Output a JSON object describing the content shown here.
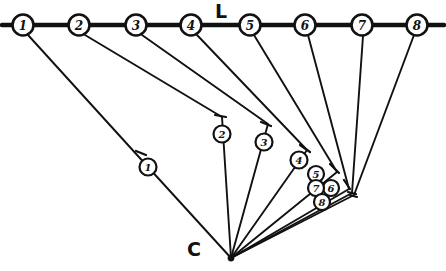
{
  "figure": {
    "title_line_label": "L",
    "title_line_label_pos": {
      "x": 221,
      "y": 11
    },
    "apex_label": "C",
    "apex_label_pos": {
      "x": 194,
      "y": 249
    },
    "apex": {
      "x": 231,
      "y": 258
    },
    "ink_color": "#111111",
    "background_color": "#ffffff",
    "line": {
      "name": "L",
      "x1": 2,
      "y1": 25,
      "x2": 444,
      "y2": 25,
      "stroke_width": 4.4
    },
    "line_nodes": [
      {
        "label": "1",
        "x": 23,
        "y": 25,
        "r": 10.5
      },
      {
        "label": "2",
        "x": 79,
        "y": 25,
        "r": 10.5
      },
      {
        "label": "3",
        "x": 136,
        "y": 25,
        "r": 10.5
      },
      {
        "label": "4",
        "x": 191,
        "y": 25,
        "r": 10.5
      },
      {
        "label": "5",
        "x": 250,
        "y": 25,
        "r": 10.5
      },
      {
        "label": "6",
        "x": 305,
        "y": 25,
        "r": 10.5
      },
      {
        "label": "7",
        "x": 362,
        "y": 25,
        "r": 10.5
      },
      {
        "label": "8",
        "x": 417,
        "y": 25,
        "r": 10.5
      }
    ],
    "rays": [
      {
        "label": "1",
        "from_node": "1",
        "path": "M 28,35 L 148,167 L 231,258",
        "marker": {
          "x": 148,
          "y": 167,
          "r": 8.5
        },
        "tick": {
          "x1": 136,
          "y1": 151,
          "x2": 146,
          "y2": 155
        }
      },
      {
        "label": "2",
        "from_node": "2",
        "path": "M 85,35 L 222,117 L 231,258",
        "marker": {
          "x": 222,
          "y": 134,
          "r": 8.5
        },
        "tick": {
          "x1": 215,
          "y1": 115,
          "x2": 226,
          "y2": 117
        }
      },
      {
        "label": "3",
        "from_node": "3",
        "path": "M 142,35 L 268,124 L 231,258",
        "marker": {
          "x": 264,
          "y": 142,
          "r": 8.5
        },
        "tick": {
          "x1": 261,
          "y1": 122,
          "x2": 271,
          "y2": 126
        }
      },
      {
        "label": "4",
        "from_node": "4",
        "path": "M 197,35 L 307,150 L 231,258",
        "marker": {
          "x": 299,
          "y": 160,
          "r": 8.5
        },
        "tick": {
          "x1": 300,
          "y1": 145,
          "x2": 310,
          "y2": 152
        }
      },
      {
        "label": "5",
        "from_node": "5",
        "path": "M 254,35 L 337,172 L 231,258",
        "marker": {
          "x": 316,
          "y": 174,
          "r": 8.0
        },
        "tick": {
          "x1": 330,
          "y1": 164,
          "x2": 339,
          "y2": 173
        }
      },
      {
        "label": "6",
        "from_node": "6",
        "path": "M 308,35 L 349,189 L 231,258",
        "marker": {
          "x": 331,
          "y": 188,
          "r": 8.0
        },
        "tick": {
          "x1": 344,
          "y1": 180,
          "x2": 350,
          "y2": 189
        }
      },
      {
        "label": "7",
        "from_node": "7",
        "path": "M 363,36 L 352,193 L 231,258",
        "marker": {
          "x": 316,
          "y": 188,
          "r": 8.0
        },
        "tick": {
          "x1": 348,
          "y1": 192,
          "x2": 356,
          "y2": 194
        }
      },
      {
        "label": "8",
        "from_node": "8",
        "path": "M 414,35 L 354,195 L 231,258",
        "marker": {
          "x": 322,
          "y": 202,
          "r": 8.0
        },
        "tick": {
          "x1": 350,
          "y1": 195,
          "x2": 357,
          "y2": 197
        }
      }
    ]
  }
}
